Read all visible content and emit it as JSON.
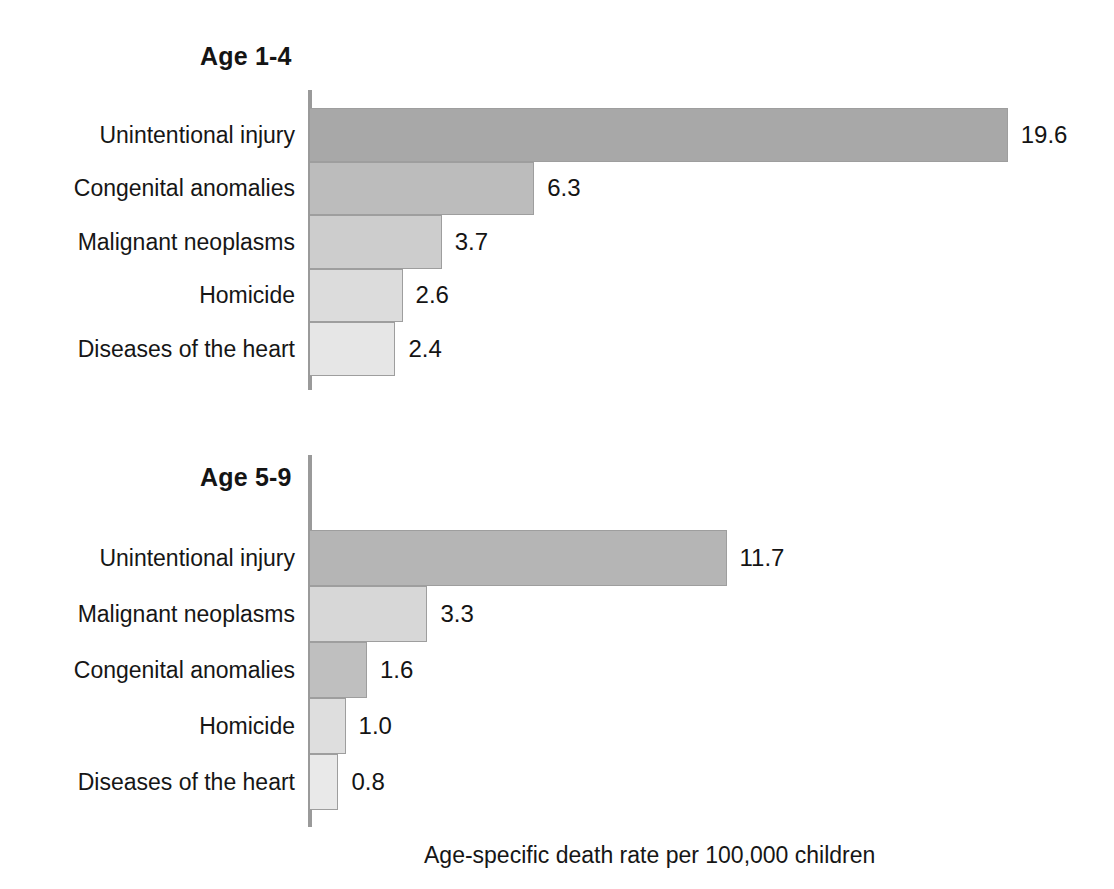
{
  "chart_data": {
    "type": "bar",
    "orientation": "horizontal",
    "title": "",
    "xlabel": "Age-specific death rate per 100,000 children",
    "ylabel": "",
    "xlim": [
      0,
      22
    ],
    "grid": false,
    "legend": null,
    "value_label_format": "one-decimal",
    "panels": [
      {
        "title": "Age 1-4",
        "categories": [
          "Unintentional injury",
          "Congenital anomalies",
          "Malignant neoplasms",
          "Homicide",
          "Diseases of the heart"
        ],
        "values": [
          19.6,
          6.3,
          3.7,
          2.6,
          2.4
        ],
        "value_labels": [
          "19.6",
          "6.3",
          "3.7",
          "2.6",
          "2.4"
        ],
        "bar_colors": [
          "#a8a8a8",
          "#bcbcbc",
          "#cdcdcd",
          "#dcdcdc",
          "#e6e6e6"
        ]
      },
      {
        "title": "Age 5-9",
        "categories": [
          "Unintentional injury",
          "Malignant neoplasms",
          "Congenital anomalies",
          "Homicide",
          "Diseases of the heart"
        ],
        "values": [
          11.7,
          3.3,
          1.6,
          1.0,
          0.8
        ],
        "value_labels": [
          "11.7",
          "3.3",
          "1.6",
          "1.0",
          "0.8"
        ],
        "bar_colors": [
          "#b5b5b5",
          "#d7d7d7",
          "#bfbfbf",
          "#dedede",
          "#e9e9e9"
        ]
      }
    ]
  },
  "axis": {
    "caption": "Age-specific death rate per 100,000 children",
    "line_color": "#9a9a9a"
  }
}
